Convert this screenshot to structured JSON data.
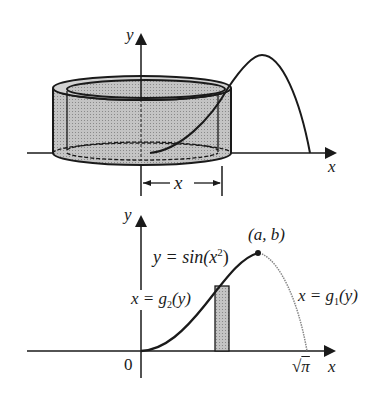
{
  "top_figure": {
    "axis_y_label": "y",
    "axis_x_label": "x",
    "dimension_label": "x",
    "description": "Cylindrical shell of radius x around the y-axis, cut by curve y = sin(x^2)"
  },
  "bottom_figure": {
    "axis_y_label": "y",
    "axis_x_label": "x",
    "origin_label": "0",
    "curve_label": "y = sin(x",
    "curve_label_sup": "2",
    "curve_label_close": ")",
    "point_label": "(a, b)",
    "left_inverse_label_pre": "x = g",
    "left_inverse_sub": "2",
    "left_inverse_post": "(y)",
    "right_inverse_label_pre": "x = g",
    "right_inverse_sub": "1",
    "right_inverse_post": "(y)",
    "x_intercept_label_root": "√",
    "x_intercept_label_arg": "π"
  },
  "colors": {
    "ink": "#1a1a1a",
    "shell_fill": "#b5b5b5",
    "shell_inner": "#cfcfcf",
    "dotted_curve": "#888888"
  }
}
